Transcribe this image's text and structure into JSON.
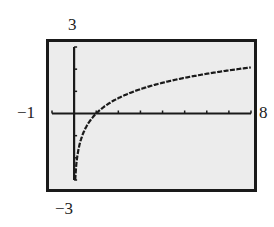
{
  "chart_data": {
    "type": "line",
    "title": "",
    "function": "y = ln(x)",
    "xlabel": "",
    "ylabel": "",
    "xlim": [
      -1,
      8
    ],
    "ylim": [
      -3,
      3
    ],
    "xscale_tick": 1,
    "yscale_tick": 1,
    "grid": false,
    "legend": null,
    "window_labels": {
      "xmin": "−1",
      "xmax": "8",
      "ymin": "−3",
      "ymax": "3"
    },
    "x": [
      0.05,
      0.1,
      0.2,
      0.3,
      0.5,
      0.75,
      1,
      1.5,
      2,
      3,
      4,
      5,
      6,
      7,
      8
    ],
    "y": [
      -3.0,
      -2.3,
      -1.61,
      -1.2,
      -0.69,
      -0.29,
      0,
      0.41,
      0.69,
      1.1,
      1.39,
      1.61,
      1.79,
      1.95,
      2.08
    ]
  },
  "colors": {
    "frame": "#1a1a1a",
    "screen_bg": "#ececec",
    "curve": "#1a1a1a"
  }
}
